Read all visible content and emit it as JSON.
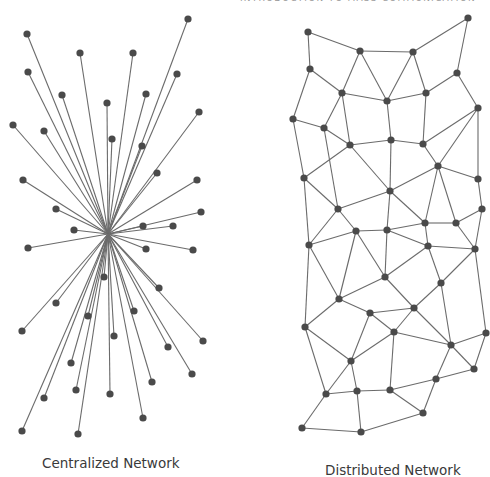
{
  "header": {
    "clipped_text": "Introduction to Mass Communication"
  },
  "style": {
    "edge_color": "#6b6b6b",
    "node_color": "#4a4a4a",
    "node_radius": 3.6,
    "edge_width": 1.1
  },
  "captions": {
    "centralized": "Centralized Network",
    "distributed": "Distributed Network"
  },
  "centralized": {
    "hub": [
      108,
      234
    ],
    "nodes": [
      [
        27,
        34
      ],
      [
        80,
        53
      ],
      [
        133,
        53
      ],
      [
        188,
        19
      ],
      [
        28,
        72
      ],
      [
        62,
        95
      ],
      [
        107,
        103
      ],
      [
        146,
        94
      ],
      [
        177,
        74
      ],
      [
        13,
        125
      ],
      [
        44,
        131
      ],
      [
        112,
        139
      ],
      [
        142,
        146
      ],
      [
        199,
        112
      ],
      [
        23,
        180
      ],
      [
        157,
        173
      ],
      [
        197,
        180
      ],
      [
        56,
        209
      ],
      [
        201,
        212
      ],
      [
        74,
        230
      ],
      [
        143,
        226
      ],
      [
        173,
        226
      ],
      [
        28,
        248
      ],
      [
        146,
        249
      ],
      [
        193,
        250
      ],
      [
        104,
        277
      ],
      [
        159,
        288
      ],
      [
        56,
        303
      ],
      [
        88,
        316
      ],
      [
        134,
        311
      ],
      [
        22,
        331
      ],
      [
        114,
        336
      ],
      [
        203,
        341
      ],
      [
        168,
        347
      ],
      [
        71,
        363
      ],
      [
        192,
        374
      ],
      [
        152,
        382
      ],
      [
        44,
        398
      ],
      [
        76,
        390
      ],
      [
        110,
        394
      ],
      [
        143,
        418
      ],
      [
        22,
        431
      ],
      [
        78,
        434
      ]
    ]
  },
  "distributed": {
    "nodes": {
      "A": [
        308,
        32
      ],
      "B": [
        360,
        51
      ],
      "C": [
        413,
        52
      ],
      "D": [
        468,
        18
      ],
      "E": [
        310,
        69
      ],
      "F": [
        342,
        93
      ],
      "G": [
        387,
        101
      ],
      "H": [
        426,
        93
      ],
      "I": [
        457,
        73
      ],
      "J": [
        293,
        119
      ],
      "K": [
        324,
        128
      ],
      "L": [
        350,
        145
      ],
      "M": [
        391,
        140
      ],
      "N": [
        423,
        144
      ],
      "O": [
        478,
        108
      ],
      "P": [
        304,
        178
      ],
      "Q": [
        338,
        209
      ],
      "R": [
        390,
        191
      ],
      "S": [
        438,
        166
      ],
      "T": [
        478,
        179
      ],
      "U": [
        356,
        231
      ],
      "V": [
        387,
        230
      ],
      "W": [
        425,
        223
      ],
      "X": [
        456,
        223
      ],
      "Y": [
        482,
        209
      ],
      "Z": [
        309,
        245
      ],
      "AA": [
        428,
        246
      ],
      "AB": [
        475,
        249
      ],
      "AC": [
        385,
        277
      ],
      "AD": [
        441,
        283
      ],
      "AE": [
        339,
        299
      ],
      "AF": [
        370,
        313
      ],
      "AG": [
        414,
        308
      ],
      "AH": [
        305,
        327
      ],
      "AI": [
        394,
        332
      ],
      "AJ": [
        451,
        345
      ],
      "AK": [
        486,
        333
      ],
      "AL": [
        474,
        369
      ],
      "AM": [
        351,
        361
      ],
      "AN": [
        436,
        379
      ],
      "AO": [
        326,
        394
      ],
      "AP": [
        357,
        391
      ],
      "AQ": [
        390,
        390
      ],
      "AR": [
        423,
        413
      ],
      "AS": [
        302,
        428
      ],
      "AT": [
        361,
        432
      ]
    },
    "edges": [
      [
        "A",
        "B"
      ],
      [
        "A",
        "E"
      ],
      [
        "B",
        "C"
      ],
      [
        "C",
        "D"
      ],
      [
        "B",
        "F"
      ],
      [
        "B",
        "G"
      ],
      [
        "C",
        "G"
      ],
      [
        "C",
        "H"
      ],
      [
        "D",
        "I"
      ],
      [
        "E",
        "F"
      ],
      [
        "E",
        "J"
      ],
      [
        "F",
        "G"
      ],
      [
        "F",
        "K"
      ],
      [
        "F",
        "L"
      ],
      [
        "G",
        "H"
      ],
      [
        "H",
        "I"
      ],
      [
        "G",
        "M"
      ],
      [
        "H",
        "N"
      ],
      [
        "I",
        "O"
      ],
      [
        "J",
        "K"
      ],
      [
        "K",
        "L"
      ],
      [
        "L",
        "M"
      ],
      [
        "M",
        "N"
      ],
      [
        "N",
        "O"
      ],
      [
        "J",
        "P"
      ],
      [
        "K",
        "Q"
      ],
      [
        "L",
        "P"
      ],
      [
        "L",
        "R"
      ],
      [
        "M",
        "R"
      ],
      [
        "N",
        "S"
      ],
      [
        "O",
        "S"
      ],
      [
        "O",
        "T"
      ],
      [
        "P",
        "Q"
      ],
      [
        "P",
        "Z"
      ],
      [
        "Q",
        "R"
      ],
      [
        "Q",
        "U"
      ],
      [
        "Q",
        "Z"
      ],
      [
        "R",
        "S"
      ],
      [
        "R",
        "V"
      ],
      [
        "R",
        "W"
      ],
      [
        "S",
        "T"
      ],
      [
        "S",
        "W"
      ],
      [
        "S",
        "X"
      ],
      [
        "T",
        "Y"
      ],
      [
        "U",
        "V"
      ],
      [
        "U",
        "Z"
      ],
      [
        "V",
        "W"
      ],
      [
        "W",
        "X"
      ],
      [
        "X",
        "Y"
      ],
      [
        "V",
        "AA"
      ],
      [
        "W",
        "AA"
      ],
      [
        "X",
        "AB"
      ],
      [
        "Y",
        "AB"
      ],
      [
        "AA",
        "AB"
      ],
      [
        "U",
        "AE"
      ],
      [
        "U",
        "AC"
      ],
      [
        "V",
        "AC"
      ],
      [
        "AA",
        "AC"
      ],
      [
        "AA",
        "AD"
      ],
      [
        "AB",
        "AD"
      ],
      [
        "Z",
        "AE"
      ],
      [
        "Z",
        "AH"
      ],
      [
        "AC",
        "AE"
      ],
      [
        "AC",
        "AG"
      ],
      [
        "AD",
        "AG"
      ],
      [
        "AE",
        "AF"
      ],
      [
        "AE",
        "AH"
      ],
      [
        "AF",
        "AG"
      ],
      [
        "AF",
        "AI"
      ],
      [
        "AG",
        "AI"
      ],
      [
        "AG",
        "AJ"
      ],
      [
        "AD",
        "AJ"
      ],
      [
        "AI",
        "AJ"
      ],
      [
        "AJ",
        "AK"
      ],
      [
        "AB",
        "AK"
      ],
      [
        "AH",
        "AM"
      ],
      [
        "AF",
        "AM"
      ],
      [
        "AI",
        "AM"
      ],
      [
        "AH",
        "AO"
      ],
      [
        "AI",
        "AQ"
      ],
      [
        "AJ",
        "AL"
      ],
      [
        "AK",
        "AL"
      ],
      [
        "AJ",
        "AN"
      ],
      [
        "AM",
        "AO"
      ],
      [
        "AM",
        "AP"
      ],
      [
        "AO",
        "AP"
      ],
      [
        "AP",
        "AQ"
      ],
      [
        "AQ",
        "AN"
      ],
      [
        "AQ",
        "AR"
      ],
      [
        "AN",
        "AL"
      ],
      [
        "AN",
        "AR"
      ],
      [
        "AO",
        "AS"
      ],
      [
        "AS",
        "AT"
      ],
      [
        "AT",
        "AR"
      ],
      [
        "AP",
        "AT"
      ]
    ]
  }
}
